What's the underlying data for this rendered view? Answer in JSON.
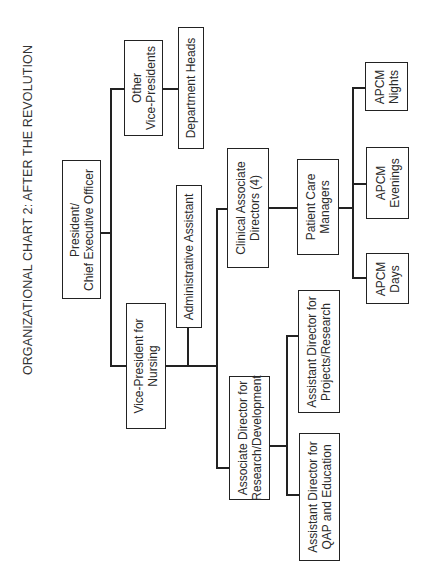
{
  "title": "ORGANIZATIONAL CHART 2: AFTER THE REVOLUTION",
  "nodes": {
    "president": {
      "line1": "President/",
      "line2": "Chief Executive Officer"
    },
    "other_vps": {
      "line1": "Other",
      "line2": "Vice-Presidents"
    },
    "department_heads": {
      "line1": "Department Heads"
    },
    "vp_nursing": {
      "line1": "Vice-President for",
      "line2": "Nursing"
    },
    "admin_assistant": {
      "line1": "Administrative Assistant"
    },
    "clinical_assoc_directors": {
      "line1": "Clinical Associate",
      "line2": "Directors (4)"
    },
    "patient_care_managers": {
      "line1": "Patient Care",
      "line2": "Managers"
    },
    "apcm_nights": {
      "line1": "APCM",
      "line2": "Nights"
    },
    "apcm_evenings": {
      "line1": "APCM",
      "line2": "Evenings"
    },
    "apcm_days": {
      "line1": "APCM",
      "line2": "Days"
    },
    "assoc_dir_research": {
      "line1": "Associate Director for",
      "line2": "Research/Development"
    },
    "asst_dir_projects": {
      "line1": "Assistant Director for",
      "line2": "Projects/Research"
    },
    "asst_dir_qap": {
      "line1": "Assistant Director for",
      "line2": "QAP and Education"
    }
  },
  "hierarchy": [
    {
      "node": "President/Chief Executive Officer",
      "children": [
        {
          "node": "Other Vice-Presidents",
          "children": [
            {
              "node": "Department Heads"
            }
          ]
        },
        {
          "node": "Vice-President for Nursing",
          "children": [
            {
              "node": "Administrative Assistant"
            },
            {
              "node": "Clinical Associate Directors (4)",
              "children": [
                {
                  "node": "Patient Care Managers",
                  "children": [
                    {
                      "node": "APCM Nights"
                    },
                    {
                      "node": "APCM Evenings"
                    },
                    {
                      "node": "APCM Days"
                    }
                  ]
                }
              ]
            },
            {
              "node": "Associate Director for Research/Development",
              "children": [
                {
                  "node": "Assistant Director for Projects/Research"
                },
                {
                  "node": "Assistant Director for QAP and Education"
                }
              ]
            }
          ]
        }
      ]
    }
  ]
}
